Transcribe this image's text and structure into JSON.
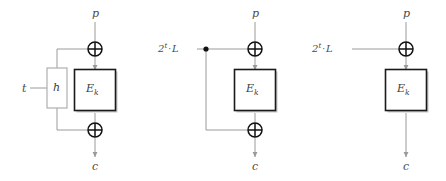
{
  "figure": {
    "colors": {
      "wire": "#9a9a9a",
      "box_border": "#1a1a1a",
      "h_box_border": "#b0b0b0",
      "xor_stroke": "#111111",
      "text": "#4a4a4a",
      "background": "#ffffff",
      "shadow": "#c8c8c8"
    },
    "diagrams": [
      {
        "id": "diagram-1",
        "name": "hash-then-encrypt",
        "labels": {
          "plaintext": "p",
          "ciphertext": "c",
          "tweak": "t",
          "hash_box": "h",
          "cipher_box": "E",
          "cipher_sub": "k"
        },
        "has_top_xor": true,
        "has_bottom_xor": true,
        "has_hash_box": true,
        "has_junction_dot": false,
        "tweak_label_kind": "plain"
      },
      {
        "id": "diagram-2",
        "name": "xex-offset-both-sides",
        "labels": {
          "plaintext": "p",
          "ciphertext": "c",
          "cipher_box": "E",
          "cipher_sub": "k",
          "offset_base": "2",
          "offset_exp": "t",
          "offset_sep": "·",
          "offset_operand": "L"
        },
        "has_top_xor": true,
        "has_bottom_xor": true,
        "has_hash_box": false,
        "has_junction_dot": true,
        "tweak_label_kind": "offset"
      },
      {
        "id": "diagram-3",
        "name": "xe-offset-input-only",
        "labels": {
          "plaintext": "p",
          "ciphertext": "c",
          "cipher_box": "E",
          "cipher_sub": "k",
          "offset_base": "2",
          "offset_exp": "t",
          "offset_sep": "·",
          "offset_operand": "L"
        },
        "has_top_xor": true,
        "has_bottom_xor": false,
        "has_hash_box": false,
        "has_junction_dot": false,
        "tweak_label_kind": "offset"
      }
    ]
  }
}
